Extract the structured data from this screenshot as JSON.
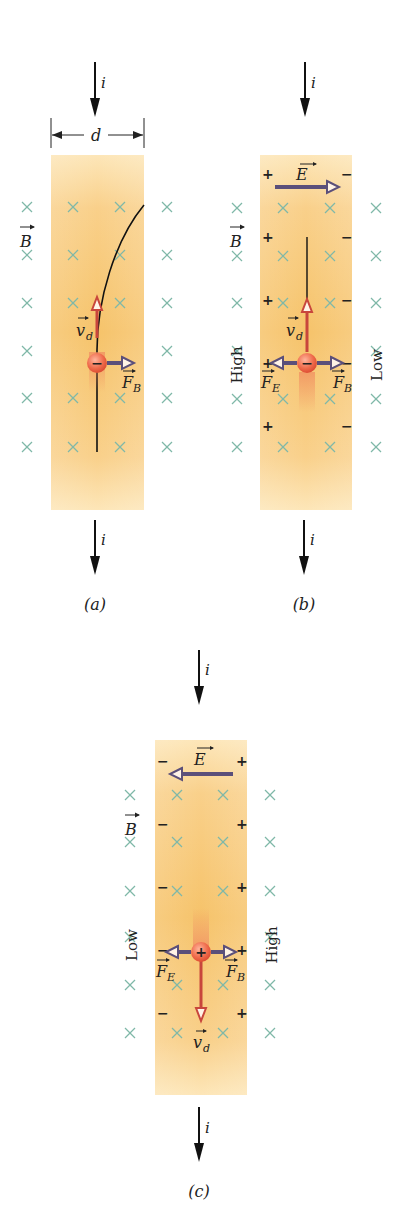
{
  "figure": {
    "panels": [
      {
        "id": "a",
        "caption": "(a)",
        "current_label_top": "i",
        "current_label_bottom": "i",
        "width_label": "d",
        "field_label": "B",
        "velocity_label": "v",
        "velocity_sub": "d",
        "force_b_label": "F",
        "force_b_sub": "B",
        "charge_sign": "−"
      },
      {
        "id": "b",
        "caption": "(b)",
        "current_label_top": "i",
        "current_label_bottom": "i",
        "field_label": "B",
        "efield_label": "E",
        "velocity_label": "v",
        "velocity_sub": "d",
        "force_e_label": "F",
        "force_e_sub": "E",
        "force_b_label": "F",
        "force_b_sub": "B",
        "left_potential": "High",
        "right_potential": "Low",
        "left_sign": "+",
        "right_sign": "−",
        "charge_sign": "−"
      },
      {
        "id": "c",
        "caption": "(c)",
        "current_label_top": "i",
        "current_label_bottom": "i",
        "field_label": "B",
        "efield_label": "E",
        "velocity_label": "v",
        "velocity_sub": "d",
        "force_e_label": "F",
        "force_e_sub": "E",
        "force_b_label": "F",
        "force_b_sub": "B",
        "left_potential": "Low",
        "right_potential": "High",
        "left_sign": "−",
        "right_sign": "+",
        "charge_sign": "+"
      }
    ],
    "colors": {
      "strip_light": "#fde3b0",
      "strip_dark": "#f7c56e",
      "field_x": "#7fb8a8",
      "velocity_arrow": "#c8463c",
      "force_arrow": "#5b4f7a",
      "charge": "#ee6a4a"
    }
  }
}
